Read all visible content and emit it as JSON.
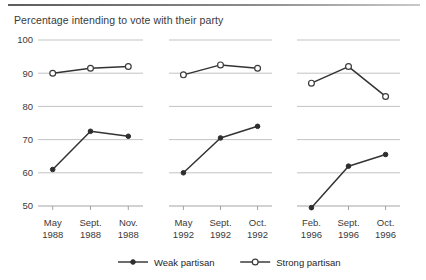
{
  "chart_data": {
    "type": "line",
    "title": "Percentage intending to vote with their party",
    "xlabel": "",
    "ylabel": "",
    "ylim": [
      50,
      100
    ],
    "yticks": [
      50,
      60,
      70,
      80,
      90,
      100
    ],
    "ytick_labels": [
      "50",
      "60",
      "70",
      "80",
      "90",
      "100"
    ],
    "grid": true,
    "legend_position": "bottom",
    "panels": [
      {
        "name": "1988",
        "categories": [
          "May\n1988",
          "Sept.\n1988",
          "Nov.\n1988"
        ],
        "tick_labels": [
          {
            "month": "May",
            "year": "1988"
          },
          {
            "month": "Sept.",
            "year": "1988"
          },
          {
            "month": "Nov.",
            "year": "1988"
          }
        ],
        "series": [
          {
            "name": "Weak partisan",
            "values": [
              61,
              72.5,
              71
            ]
          },
          {
            "name": "Strong partisan",
            "values": [
              90,
              91.5,
              92
            ]
          }
        ]
      },
      {
        "name": "1992",
        "categories": [
          "May\n1992",
          "Sept.\n1992",
          "Oct.\n1992"
        ],
        "tick_labels": [
          {
            "month": "May",
            "year": "1992"
          },
          {
            "month": "Sept.",
            "year": "1992"
          },
          {
            "month": "Oct.",
            "year": "1992"
          }
        ],
        "series": [
          {
            "name": "Weak partisan",
            "values": [
              60,
              70.5,
              74
            ]
          },
          {
            "name": "Strong partisan",
            "values": [
              89.5,
              92.5,
              91.5
            ]
          }
        ]
      },
      {
        "name": "1996",
        "categories": [
          "Feb.\n1996",
          "Sept.\n1996",
          "Oct.\n1996"
        ],
        "tick_labels": [
          {
            "month": "Feb.",
            "year": "1996"
          },
          {
            "month": "Sept.",
            "year": "1996"
          },
          {
            "month": "Oct.",
            "year": "1996"
          }
        ],
        "series": [
          {
            "name": "Weak partisan",
            "values": [
              49.5,
              62,
              65.5
            ]
          },
          {
            "name": "Strong partisan",
            "values": [
              87,
              92,
              83
            ]
          }
        ]
      }
    ],
    "legend": [
      {
        "label": "Weak partisan",
        "marker": "filled-circle",
        "color": "#2e2e2e"
      },
      {
        "label": "Strong partisan",
        "marker": "open-circle",
        "color": "#2e2e2e"
      }
    ],
    "colors": {
      "line": "#333333",
      "grid": "#b4b4b4",
      "text": "#3a3a3a",
      "background": "#ffffff"
    }
  }
}
